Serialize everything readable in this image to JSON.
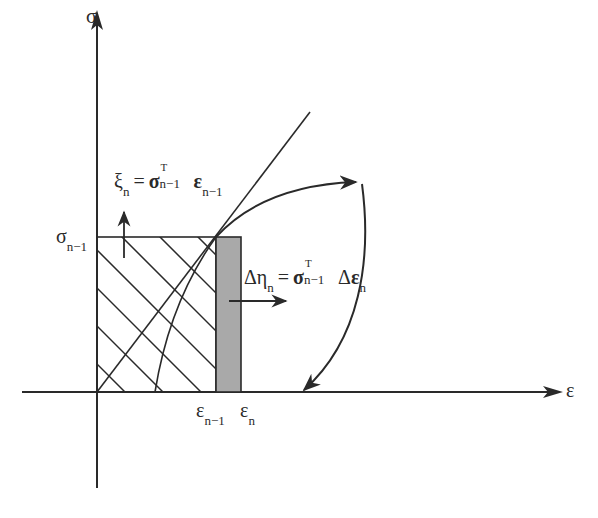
{
  "diagram": {
    "type": "stress-strain energy diagram",
    "axes": {
      "y_label": "σ",
      "x_label": "ε"
    },
    "ticks": {
      "sigma_prev": {
        "base": "σ",
        "sub": "n−1"
      },
      "eps_prev": {
        "base": "ε",
        "sub": "n−1"
      },
      "eps_n": {
        "base": "ε",
        "sub": "n"
      }
    },
    "equations": {
      "xi": {
        "lhs": "ξ",
        "lhs_sub": "n",
        "eq": "=",
        "sigma": "σ",
        "sigma_sup": "T",
        "sigma_sub": "n−1",
        "eps": "ε",
        "eps_sub": "n−1"
      },
      "delta_eta": {
        "lhs": "Δη",
        "lhs_sub": "n",
        "eq": "=",
        "sigma": "σ",
        "sigma_sup": "T",
        "sigma_sub": "n−1",
        "delta": "Δ",
        "eps": "ε",
        "eps_sub": "n"
      }
    },
    "colors": {
      "line": "#2a2a2a",
      "strip_fill": "#a9a9a9",
      "background": "#ffffff"
    }
  }
}
